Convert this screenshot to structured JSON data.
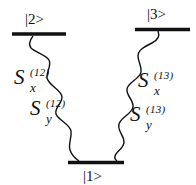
{
  "diagram": {
    "type": "energy-level-diagram",
    "levels": [
      {
        "id": "level-2",
        "label": "|2>",
        "bar": {
          "x1": 12,
          "x2": 66,
          "y": 34
        },
        "label_pos": {
          "x": 25,
          "y": 12
        }
      },
      {
        "id": "level-3",
        "label": "|3>",
        "bar": {
          "x1": 135,
          "x2": 190,
          "y": 29
        },
        "label_pos": {
          "x": 147,
          "y": 7
        }
      },
      {
        "id": "level-1",
        "label": "|1>",
        "bar": {
          "x1": 68,
          "x2": 124,
          "y": 162
        },
        "label_pos": {
          "x": 83,
          "y": 169
        }
      }
    ],
    "transitions": [
      {
        "id": "transition-1-2",
        "from": "|1>",
        "to": "|2>",
        "style": "wavy",
        "labels": [
          {
            "base": "S",
            "sup": "(12)",
            "sub": "x",
            "pos": {
              "x": 14,
              "y": 67
            }
          },
          {
            "base": "S",
            "sup": "(12)",
            "sub": "y",
            "pos": {
              "x": 30,
              "y": 98
            }
          }
        ]
      },
      {
        "id": "transition-1-3",
        "from": "|1>",
        "to": "|3>",
        "style": "wavy",
        "labels": [
          {
            "base": "S",
            "sup": "(13)",
            "sub": "x",
            "pos": {
              "x": 138,
              "y": 70
            }
          },
          {
            "base": "S",
            "sup": "(13)",
            "sub": "y",
            "pos": {
              "x": 130,
              "y": 104
            }
          }
        ]
      }
    ],
    "colors": {
      "line": "#111111",
      "background": "#ffffff"
    }
  }
}
